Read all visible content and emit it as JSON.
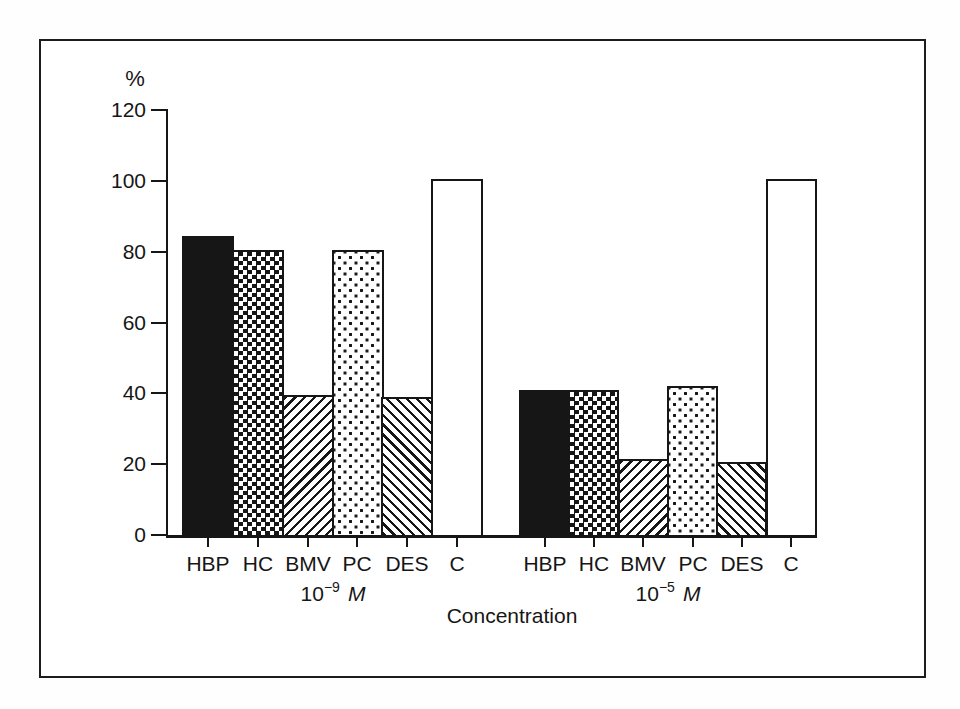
{
  "chart_data": {
    "type": "bar",
    "title": "",
    "ylabel": "%",
    "xlabel": "Concentration",
    "ylim": [
      0,
      120
    ],
    "yticks": [
      0,
      20,
      40,
      60,
      80,
      100,
      120
    ],
    "grid": false,
    "legend": "none",
    "categories": [
      "HBP",
      "HC",
      "BMV",
      "PC",
      "DES",
      "C"
    ],
    "bar_patterns": [
      "solid",
      "checker",
      "hatch-up",
      "dots",
      "hatch-down",
      "open"
    ],
    "groups": [
      {
        "name": "conc-1e-9",
        "concentration": {
          "base": "10",
          "exponent": "−9",
          "unit": "M"
        },
        "values": [
          84.5,
          80.5,
          39.5,
          80.5,
          39,
          100.5
        ]
      },
      {
        "name": "conc-1e-5",
        "concentration": {
          "base": "10",
          "exponent": "−5",
          "unit": "M"
        },
        "values": [
          41,
          41,
          21.5,
          42,
          20.5,
          100.5
        ]
      }
    ],
    "colors": {
      "ink": "#161616",
      "paper": "#ffffff"
    }
  }
}
